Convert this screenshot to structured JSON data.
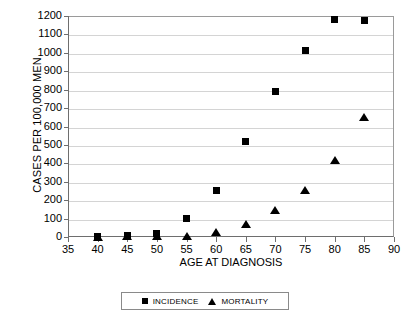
{
  "chart_data": {
    "type": "scatter",
    "title": "",
    "xlabel": "AGE AT DIAGNOSIS",
    "ylabel": "CASES PER 100,000 MEN",
    "xlim": [
      35,
      90
    ],
    "ylim": [
      0,
      1200
    ],
    "x_ticks": [
      35,
      40,
      45,
      50,
      55,
      60,
      65,
      70,
      75,
      80,
      85,
      90
    ],
    "y_ticks": [
      0,
      100,
      200,
      300,
      400,
      500,
      600,
      700,
      800,
      900,
      1000,
      1100,
      1200
    ],
    "grid": true,
    "legend_position": "bottom",
    "x": [
      40,
      45,
      50,
      55,
      60,
      65,
      70,
      75,
      80,
      85
    ],
    "series": [
      {
        "name": "INCIDENCE",
        "marker": "square",
        "color": "#000000",
        "values": [
          5,
          10,
          20,
          100,
          250,
          520,
          790,
          1015,
          1180,
          1175
        ]
      },
      {
        "name": "MORTALITY",
        "marker": "triangle",
        "color": "#000000",
        "values": [
          2,
          5,
          8,
          8,
          25,
          70,
          145,
          255,
          420,
          650
        ]
      }
    ]
  }
}
